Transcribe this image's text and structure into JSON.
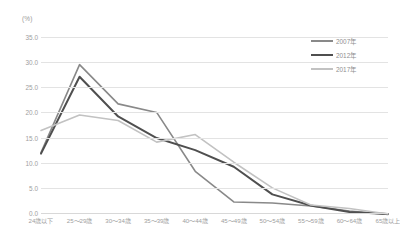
{
  "chart_data": {
    "type": "line",
    "title": "",
    "xlabel": "",
    "ylabel": "(%)",
    "unit_label": "(%)",
    "ylim": [
      0.0,
      35.0
    ],
    "ytick_step": 5.0,
    "ytick_labels": [
      "35.0",
      "30.0",
      "25.0",
      "20.0",
      "15.0",
      "10.0",
      "5.0",
      "0.0"
    ],
    "ytick_values": [
      35.0,
      30.0,
      25.0,
      20.0,
      15.0,
      10.0,
      5.0,
      0.0
    ],
    "grid": true,
    "legend_position": "top-right",
    "categories": [
      "24歳以下",
      "25～29歳",
      "30～34歳",
      "35～39歳",
      "40～44歳",
      "45～49歳",
      "50～54歳",
      "55～59歳",
      "60～64歳",
      "65歳以上"
    ],
    "series": [
      {
        "name": "2007年",
        "color": "#898989",
        "width": 1.6,
        "values": [
          12.0,
          29.5,
          21.7,
          20.0,
          8.3,
          2.2,
          2.0,
          1.4,
          0.4,
          -0.3
        ]
      },
      {
        "name": "2012年",
        "color": "#4f4f4f",
        "width": 2.0,
        "values": [
          11.8,
          27.1,
          19.2,
          14.9,
          12.5,
          9.2,
          3.7,
          1.5,
          0.2,
          -0.2
        ]
      },
      {
        "name": "2017年",
        "color": "#c2c2c2",
        "width": 1.6,
        "values": [
          16.4,
          19.5,
          18.4,
          14.1,
          15.6,
          10.1,
          5.0,
          1.6,
          0.9,
          -0.2
        ]
      }
    ]
  },
  "legend": {
    "items": [
      {
        "label": "2007年"
      },
      {
        "label": "2012年"
      },
      {
        "label": "2017年"
      }
    ]
  }
}
